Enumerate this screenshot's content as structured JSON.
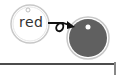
{
  "diagram": {
    "source_tag": {
      "label": "red",
      "fill": "#ffffff",
      "stroke": "#c8c8c8"
    },
    "target_tag": {
      "label": "",
      "fill": "#606060",
      "stroke": "#c8c8c8"
    },
    "connector": {
      "type": "looped-arrow",
      "color": "#111111"
    },
    "baseline_color": "#111111"
  }
}
